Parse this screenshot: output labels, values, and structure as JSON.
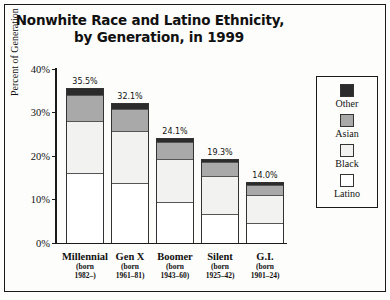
{
  "chart_data": {
    "type": "bar",
    "subtype": "stacked-bar",
    "title": "Nonwhite Race and Latino Ethnicity, by Generation, in 1999",
    "title_line1": "Nonwhite Race and Latino Ethnicity,",
    "title_line2": "by Generation, in 1999",
    "xlabel": "",
    "ylabel": "Percent of Generation",
    "ylim": [
      0,
      40
    ],
    "yticks": [
      0,
      10,
      20,
      30,
      40
    ],
    "ytick_labels": [
      "0%",
      "10%",
      "20%",
      "30%",
      "40%"
    ],
    "grid": false,
    "legend_position": "right",
    "categories": [
      "Millennial",
      "Gen X",
      "Boomer",
      "Silent",
      "G.I."
    ],
    "category_sublabels": [
      [
        "(born",
        "1982–)"
      ],
      [
        "(born",
        "1961–81)"
      ],
      [
        "(born",
        "1943–60)"
      ],
      [
        "(born",
        "1925–42)"
      ],
      [
        "(born",
        "1901–24)"
      ]
    ],
    "totals": [
      35.5,
      32.1,
      24.1,
      19.3,
      14.0
    ],
    "total_labels": [
      "35.5%",
      "32.1%",
      "24.1%",
      "19.3%",
      "14.0%"
    ],
    "series": [
      {
        "name": "Latino",
        "color": "#ffffff",
        "values": [
          16.2,
          13.9,
          9.5,
          6.6,
          4.6
        ]
      },
      {
        "name": "Black",
        "color": "#f2f2f0",
        "values": [
          12.0,
          12.0,
          10.0,
          9.0,
          6.6
        ]
      },
      {
        "name": "Asian",
        "color": "#a9a9a9",
        "values": [
          5.8,
          5.0,
          3.8,
          3.2,
          2.3
        ]
      },
      {
        "name": "Other",
        "color": "#2b2b2b",
        "values": [
          1.5,
          1.2,
          0.8,
          0.5,
          0.5
        ]
      }
    ],
    "legend_entries": [
      {
        "label": "Other",
        "color": "#2b2b2b"
      },
      {
        "label": "Asian",
        "color": "#a9a9a9"
      },
      {
        "label": "Black",
        "color": "#f2f2f0"
      },
      {
        "label": "Latino",
        "color": "#ffffff"
      }
    ]
  }
}
